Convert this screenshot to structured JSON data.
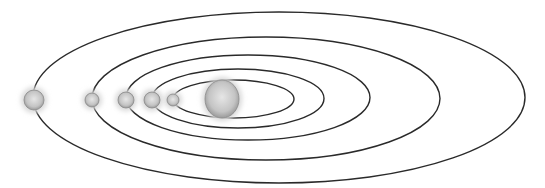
{
  "diagram": {
    "type": "solar-system-orbits",
    "background": "#ffffff",
    "orbit_color": "#2a2a2a",
    "planet_color": "#c8c8c8",
    "sun_color": "#d0d0d0",
    "sun": {
      "cx": 222,
      "cy": 99,
      "rx": 17,
      "ry": 19
    },
    "orbits": [
      {
        "left": 173,
        "right": 294,
        "top": 80,
        "bottom": 118
      },
      {
        "left": 152,
        "right": 324,
        "top": 69,
        "bottom": 128
      },
      {
        "left": 126,
        "right": 370,
        "top": 55,
        "bottom": 140
      },
      {
        "left": 92,
        "right": 440,
        "top": 37,
        "bottom": 160
      },
      {
        "left": 33,
        "right": 525,
        "top": 12,
        "bottom": 183
      }
    ],
    "planets": [
      {
        "cx": 173,
        "cy": 100,
        "r": 6
      },
      {
        "cx": 152,
        "cy": 100,
        "r": 8
      },
      {
        "cx": 126,
        "cy": 100,
        "r": 8
      },
      {
        "cx": 92,
        "cy": 100,
        "r": 7
      },
      {
        "cx": 34,
        "cy": 100,
        "r": 10
      }
    ]
  }
}
